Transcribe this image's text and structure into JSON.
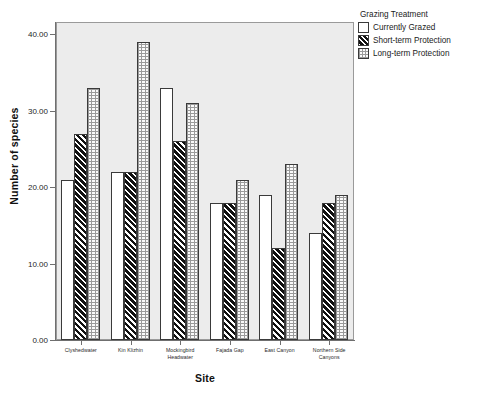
{
  "chart_data": {
    "type": "bar",
    "title": "",
    "xlabel": "Site",
    "ylabel": "Number of species",
    "ylim": [
      0,
      41.5
    ],
    "yticks": [
      0,
      10,
      20,
      30,
      40
    ],
    "ytick_labels": [
      "0.00",
      "10.00",
      "20.00",
      "30.00",
      "40.00"
    ],
    "grid": false,
    "legend_position": "right",
    "legend_title": "Grazing Treatment",
    "categories": [
      "Clyshedwater",
      "Kin Klizhin",
      "Mockingbird Headwater",
      "Fajada Gap",
      "East Canyon",
      "Northern Side Canyons"
    ],
    "category_lines": [
      [
        "Clyshedwater"
      ],
      [
        "Kin Klizhin"
      ],
      [
        "Mockingbird",
        "Headwater"
      ],
      [
        "Fajada Gap"
      ],
      [
        "East Canyon"
      ],
      [
        "Northern Side",
        "Canyons"
      ]
    ],
    "series": [
      {
        "name": "Currently Grazed",
        "pattern": "solid-white",
        "values": [
          21,
          22,
          33,
          18,
          19,
          14
        ]
      },
      {
        "name": "Short-term Protection",
        "pattern": "diagonal-hatch",
        "values": [
          27,
          22,
          26,
          18,
          12,
          18
        ]
      },
      {
        "name": "Long-term Protection",
        "pattern": "dotted-grid",
        "values": [
          33,
          39,
          31,
          21,
          23,
          19
        ]
      }
    ]
  },
  "legend": {
    "title": "Grazing Treatment",
    "items": [
      {
        "label": "Currently Grazed",
        "swatch": "solid-white"
      },
      {
        "label": "Short-term Protection",
        "swatch": "diagonal-hatch"
      },
      {
        "label": "Long-term Protection",
        "swatch": "dotted-grid"
      }
    ]
  },
  "colors": {
    "plot_background": "#ececec",
    "page_background": "#ffffff",
    "axis": "#6f6f6f",
    "bar_outline": "#3a3a3a",
    "text": "#1a1a1a"
  }
}
